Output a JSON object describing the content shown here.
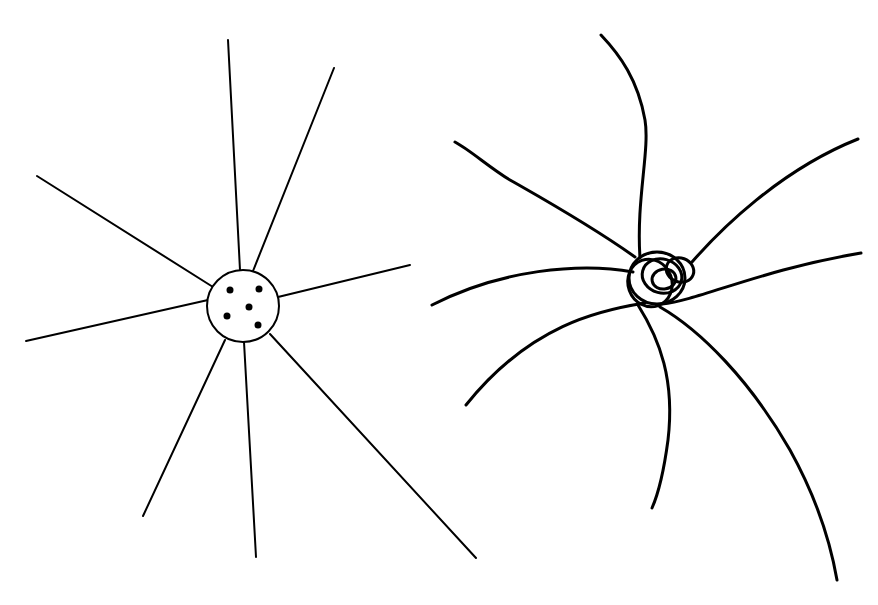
{
  "canvas": {
    "width": 878,
    "height": 605,
    "background": "#ffffff",
    "ink": "#000000"
  },
  "figures": [
    {
      "id": "left",
      "description": "Small circle with five dots and eight straight radiating rays",
      "center_circle": {
        "cx": 243,
        "cy": 306,
        "r": 36,
        "stroke_width": 2
      },
      "dots": [
        {
          "cx": 230,
          "cy": 290,
          "r": 3.5
        },
        {
          "cx": 259,
          "cy": 289,
          "r": 3.5
        },
        {
          "cx": 249,
          "cy": 307,
          "r": 3.5
        },
        {
          "cx": 227,
          "cy": 316,
          "r": 3.5
        },
        {
          "cx": 258,
          "cy": 325,
          "r": 3.5
        }
      ],
      "ray_stroke_width": 2,
      "rays": [
        {
          "x1": 240,
          "y1": 270,
          "x2": 228,
          "y2": 40
        },
        {
          "x1": 253,
          "y1": 271,
          "x2": 334,
          "y2": 68
        },
        {
          "x1": 278,
          "y1": 297,
          "x2": 410,
          "y2": 265
        },
        {
          "x1": 270,
          "y1": 334,
          "x2": 476,
          "y2": 558
        },
        {
          "x1": 244,
          "y1": 342,
          "x2": 256,
          "y2": 557
        },
        {
          "x1": 225,
          "y1": 340,
          "x2": 143,
          "y2": 516
        },
        {
          "x1": 208,
          "y1": 300,
          "x2": 26,
          "y2": 341
        },
        {
          "x1": 213,
          "y1": 287,
          "x2": 37,
          "y2": 176
        }
      ]
    },
    {
      "id": "right",
      "description": "Tangled knot with seven curved strands radiating outward",
      "stroke_width": 3,
      "knot_loops": [
        {
          "cx": 657,
          "cy": 278,
          "rx": 28,
          "ry": 26,
          "rotate": 0
        },
        {
          "cx": 662,
          "cy": 276,
          "rx": 20,
          "ry": 17,
          "rotate": 15
        },
        {
          "cx": 664,
          "cy": 279,
          "rx": 12,
          "ry": 10,
          "rotate": -10
        },
        {
          "cx": 680,
          "cy": 270,
          "rx": 14,
          "ry": 12,
          "rotate": 20
        },
        {
          "cx": 650,
          "cy": 283,
          "rx": 22,
          "ry": 24,
          "rotate": -20
        }
      ],
      "strands": [
        "M 640 258 C 636 200, 650 150, 645 120 C 638 80, 620 55, 601 35",
        "M 635 257 C 590 225, 545 200, 510 180 C 490 168, 470 150, 455 142",
        "M 633 272 C 580 262, 500 270, 432 305",
        "M 645 303 C 600 310, 530 325, 466 405",
        "M 638 305 C 660 340, 675 380, 668 440 C 664 470, 660 490, 652 508",
        "M 660 307 C 700 330, 750 380, 790 450 C 815 495, 830 540, 837 580",
        "M 662 304 C 700 300, 760 270, 861 253",
        "M 692 262 C 720 230, 780 170, 858 139"
      ]
    }
  ]
}
